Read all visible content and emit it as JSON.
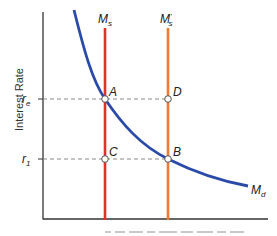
{
  "diagram": {
    "type": "money-market-equilibrium",
    "y_axis": {
      "title": "Interest Rate",
      "ticks": [
        {
          "label": "r",
          "sub": "e"
        },
        {
          "label": "r",
          "sub": "1"
        }
      ]
    },
    "curves": {
      "money_supply": {
        "label": "M",
        "sub": "s",
        "prime": "",
        "color": "#e0302a"
      },
      "money_supply_new": {
        "label": "M",
        "sub": "s",
        "prime": "'",
        "color": "#f07a32"
      },
      "money_demand": {
        "label": "M",
        "sub": "d",
        "color": "#2a4aa8"
      }
    },
    "points": [
      {
        "id": "A",
        "label": "A"
      },
      {
        "id": "D",
        "label": "D"
      },
      {
        "id": "C",
        "label": "C"
      },
      {
        "id": "B",
        "label": "B"
      }
    ],
    "colors": {
      "axis": "#333333",
      "guide": "#888888"
    }
  }
}
